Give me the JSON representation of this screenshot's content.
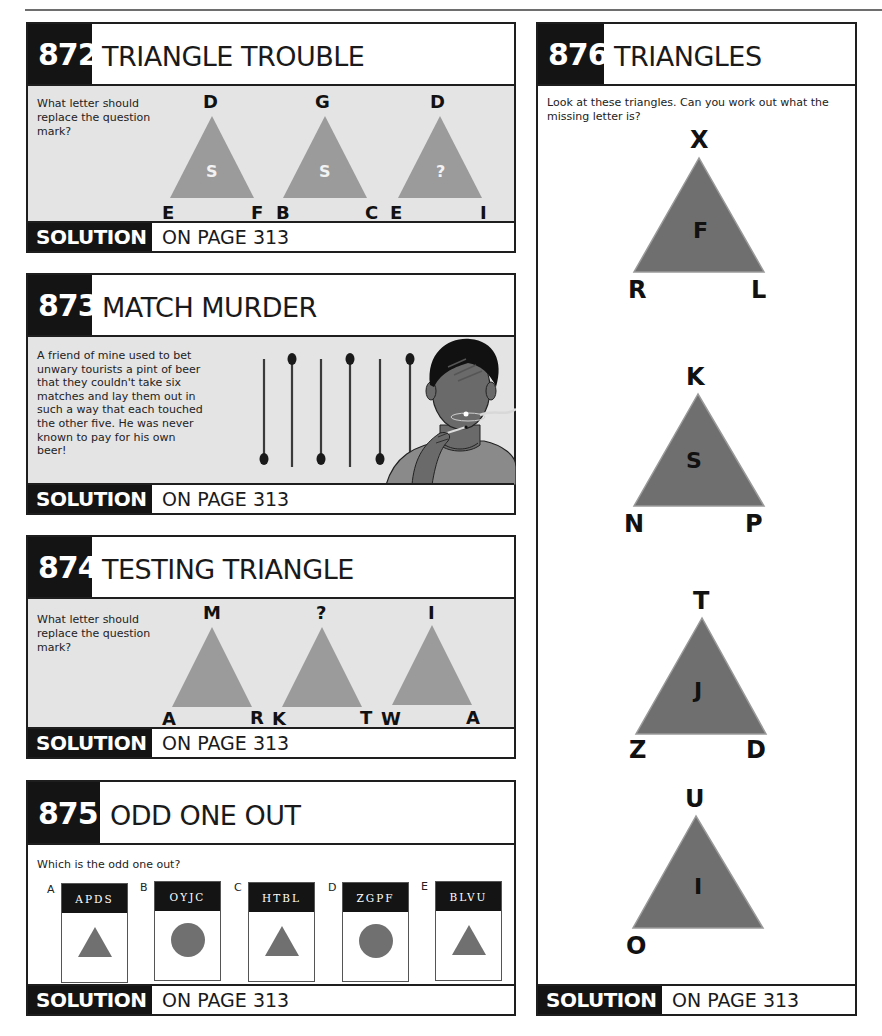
{
  "page": {
    "puzzles": [
      {
        "number": "872",
        "title": "TRIANGLE TROUBLE",
        "question": "What letter should replace the question mark?",
        "triangles": [
          {
            "top": "D",
            "left": "E",
            "right": "F",
            "center": "S"
          },
          {
            "top": "G",
            "left": "B",
            "right": "C",
            "center": "S"
          },
          {
            "top": "D",
            "left": "E",
            "right": "I",
            "center": "?"
          }
        ],
        "solution_label": "SOLUTION",
        "solution_page": "ON PAGE 313"
      },
      {
        "number": "873",
        "title": "MATCH MURDER",
        "question": "A friend of mine used to bet unwary tourists a pint of beer that they couldn't take six matches and lay them out in such a way that each touched the other five. He was never known to pay for his own beer!",
        "illustration": "six-matches-and-man-lighting-match",
        "solution_label": "SOLUTION",
        "solution_page": "ON PAGE 313"
      },
      {
        "number": "874",
        "title": "TESTING TRIANGLE",
        "question": "What letter should replace the question mark?",
        "triangles": [
          {
            "top": "M",
            "left": "A",
            "right": "R"
          },
          {
            "top": "?",
            "left": "K",
            "right": "T"
          },
          {
            "top": "I",
            "left": "W",
            "right": "A"
          }
        ],
        "solution_label": "SOLUTION",
        "solution_page": "ON PAGE 313"
      },
      {
        "number": "875",
        "title": "ODD ONE OUT",
        "question": "Which is the odd one out?",
        "cards": [
          {
            "letter": "A",
            "code": "APDS",
            "shape": "triangle"
          },
          {
            "letter": "B",
            "code": "OYJC",
            "shape": "circle"
          },
          {
            "letter": "C",
            "code": "HTBL",
            "shape": "triangle"
          },
          {
            "letter": "D",
            "code": "ZGPF",
            "shape": "circle"
          },
          {
            "letter": "E",
            "code": "BLVU",
            "shape": "triangle"
          }
        ],
        "solution_label": "SOLUTION",
        "solution_page": "ON PAGE 313"
      },
      {
        "number": "876",
        "title": "TRIANGLES",
        "question": "Look at these triangles. Can you work out what the missing letter is?",
        "triangles": [
          {
            "top": "X",
            "left": "R",
            "right": "L",
            "center": "F"
          },
          {
            "top": "K",
            "left": "N",
            "right": "P",
            "center": "S"
          },
          {
            "top": "T",
            "left": "Z",
            "right": "D",
            "center": "J"
          },
          {
            "top": "U",
            "left": "O",
            "right": "",
            "center": "I"
          }
        ],
        "solution_label": "SOLUTION",
        "solution_page": "ON PAGE 313"
      }
    ],
    "colors": {
      "header_black": "#141414",
      "body_grey": "#e4e4e4",
      "light_triangle": "#9b9b9b",
      "dark_triangle": "#6f6f6f",
      "shape_grey": "#707070"
    }
  }
}
